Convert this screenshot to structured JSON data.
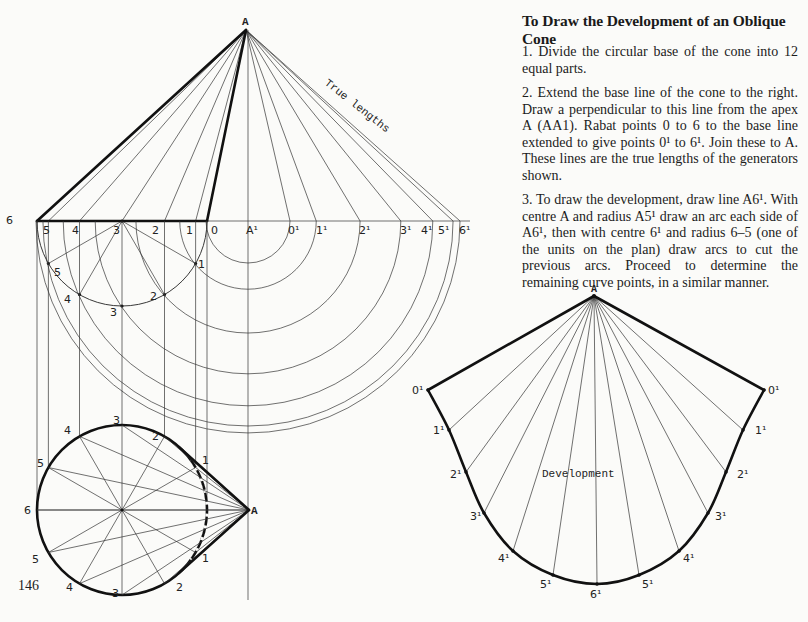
{
  "header": {
    "title": "To Draw the Development of an Oblique Cone"
  },
  "steps": [
    "1. Divide the circular base of the cone into 12 equal parts.",
    "2. Extend the base line of the cone to the right. Draw a perpendicular to this line from the apex A (AA1). Rabat points 0 to 6 to the base line extended to give points 0¹ to 6¹. Join these to A. These lines are the true lengths of the generators shown.",
    "3. To draw the development, draw line A6¹. With centre A and radius A5¹ draw an arc each side of A6¹, then with centre 6¹ and radius 6–5 (one of the units on the plan) draw arcs to cut the previous arcs. Proceed to determine the remaining curve points, in a similar manner."
  ],
  "page_number": "146",
  "diagram": {
    "elevation": {
      "apex_label": "A",
      "foot_label": "A¹",
      "annotation": "True lengths",
      "base_labels": [
        "6",
        "5",
        "4",
        "3",
        "2",
        "1",
        "0"
      ],
      "true_length_labels": [
        "0¹",
        "1¹",
        "2¹",
        "3¹",
        "4¹",
        "5¹",
        "6¹"
      ],
      "semicircle_labels": [
        "5",
        "4",
        "3",
        "2",
        "1"
      ]
    },
    "plan": {
      "apex_label": "A",
      "point_labels_top": [
        "6",
        "5",
        "4",
        "3",
        "2",
        "1"
      ],
      "point_labels_bottom": [
        "5",
        "4",
        "3",
        "2",
        "1"
      ]
    },
    "development": {
      "apex_label": "A",
      "caption": "Development",
      "left_labels": [
        "0¹",
        "1¹",
        "2¹",
        "3¹",
        "4¹",
        "5¹"
      ],
      "bottom_label": "6¹",
      "right_labels": [
        "0¹",
        "1¹",
        "2¹",
        "3¹",
        "4¹",
        "5¹"
      ]
    }
  }
}
